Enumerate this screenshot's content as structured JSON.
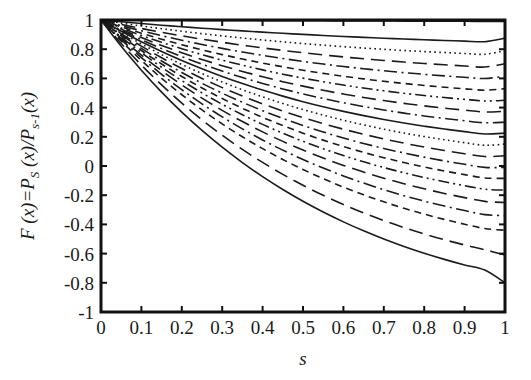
{
  "chart_data": {
    "type": "line",
    "title": "",
    "subtitle": "",
    "xlabel": "s",
    "ylabel": "F (x)=P_s(x)/P_{s-1}(x)",
    "ylabel_parts": {
      "f_of_x": "F (x)=P",
      "sub_s": "S",
      "mid": " (x)/P",
      "sub_s_minus_1": "s-1",
      "tail": "(x)"
    },
    "xlim": [
      0,
      1
    ],
    "ylim": [
      -1,
      1
    ],
    "xticks": [
      0,
      0.1,
      0.2,
      0.3,
      0.4,
      0.5,
      0.6,
      0.7,
      0.8,
      0.9,
      1
    ],
    "xtick_labels": [
      "0",
      "0.1",
      "0.2",
      "0.3",
      "0.4",
      "0.5",
      "0.6",
      "0.7",
      "0.8",
      "0.9",
      "1"
    ],
    "yticks": [
      -1,
      -0.8,
      -0.6,
      -0.4,
      -0.2,
      0,
      0.2,
      0.4,
      0.6,
      0.8,
      1
    ],
    "ytick_labels": [
      "-1",
      "-0.8",
      "-0.6",
      "-0.4",
      "-0.2",
      "0",
      "0.2",
      "0.4",
      "0.6",
      "0.8",
      "1"
    ],
    "grid": false,
    "legend": false,
    "legend_position": "none",
    "frame": "box",
    "tick_direction": "in",
    "line_color": "#1b1b1b",
    "background_color": "#ffffff",
    "x": [
      0,
      0.05,
      0.1,
      0.15,
      0.2,
      0.25,
      0.3,
      0.35,
      0.4,
      0.45,
      0.5,
      0.55,
      0.6,
      0.65,
      0.7,
      0.75,
      0.8,
      0.85,
      0.9,
      0.95,
      1
    ],
    "series": [
      {
        "name": "curve-1",
        "style": "solid",
        "endpoint": 0.99,
        "values": [
          1,
          0.9995,
          0.999,
          0.9985,
          0.998,
          0.9975,
          0.997,
          0.9965,
          0.996,
          0.9955,
          0.995,
          0.9945,
          0.994,
          0.9935,
          0.993,
          0.9925,
          0.992,
          0.9915,
          0.991,
          0.9905,
          0.99
        ]
      },
      {
        "name": "curve-2",
        "style": "solid",
        "endpoint": 0.875,
        "values": [
          1,
          0.9875,
          0.9757,
          0.9645,
          0.9539,
          0.9439,
          0.9344,
          0.9254,
          0.9169,
          0.9089,
          0.9013,
          0.8942,
          0.8875,
          0.8812,
          0.8753,
          0.8698,
          0.8647,
          0.8599,
          0.8555,
          0.8514,
          0.875
        ]
      },
      {
        "name": "curve-3",
        "style": "dotted",
        "endpoint": 0.79,
        "values": [
          1,
          0.9788,
          0.9589,
          0.9403,
          0.9228,
          0.9064,
          0.891,
          0.8766,
          0.8631,
          0.8505,
          0.8387,
          0.8277,
          0.8175,
          0.808,
          0.7992,
          0.7911,
          0.7837,
          0.7769,
          0.7707,
          0.7651,
          0.79
        ]
      },
      {
        "name": "curve-4",
        "style": "dashed-long",
        "endpoint": 0.7,
        "values": [
          1,
          0.9701,
          0.9421,
          0.9159,
          0.8915,
          0.8686,
          0.8473,
          0.8274,
          0.8089,
          0.7917,
          0.7757,
          0.7608,
          0.7471,
          0.7344,
          0.7227,
          0.712,
          0.7022,
          0.6933,
          0.6852,
          0.6779,
          0.7
        ]
      },
      {
        "name": "curve-5",
        "style": "dash-dot",
        "endpoint": 0.615,
        "values": [
          1,
          0.9617,
          0.9259,
          0.8925,
          0.8614,
          0.8325,
          0.8056,
          0.7806,
          0.7575,
          0.7361,
          0.7164,
          0.6982,
          0.6815,
          0.6662,
          0.6522,
          0.6394,
          0.6278,
          0.6173,
          0.6078,
          0.5993,
          0.615
        ]
      },
      {
        "name": "curve-6",
        "style": "dashed",
        "endpoint": 0.53,
        "values": [
          1,
          0.953,
          0.9092,
          0.8684,
          0.8305,
          0.7954,
          0.7629,
          0.7328,
          0.7051,
          0.6795,
          0.6559,
          0.6343,
          0.6145,
          0.5965,
          0.5801,
          0.5652,
          0.5518,
          0.5397,
          0.5289,
          0.5193,
          0.53
        ]
      },
      {
        "name": "curve-7",
        "style": "dash-dot-dot",
        "endpoint": 0.45,
        "values": [
          1,
          0.9452,
          0.8944,
          0.8471,
          0.8033,
          0.7627,
          0.7251,
          0.6904,
          0.6584,
          0.629,
          0.6019,
          0.5771,
          0.5545,
          0.5338,
          0.515,
          0.498,
          0.4827,
          0.4689,
          0.4566,
          0.4457,
          0.45
        ]
      },
      {
        "name": "curve-8",
        "style": "dashed-long",
        "endpoint": 0.375,
        "values": [
          1,
          0.9376,
          0.8796,
          0.8258,
          0.7759,
          0.7297,
          0.687,
          0.6476,
          0.6112,
          0.5777,
          0.547,
          0.5188,
          0.4931,
          0.4697,
          0.4484,
          0.4292,
          0.4118,
          0.3963,
          0.3824,
          0.37,
          0.375
        ]
      },
      {
        "name": "curve-9",
        "style": "dash-dot",
        "endpoint": 0.3,
        "values": [
          1,
          0.93,
          0.8651,
          0.8049,
          0.7492,
          0.6977,
          0.65,
          0.606,
          0.5655,
          0.5281,
          0.4938,
          0.4623,
          0.4336,
          0.4074,
          0.3837,
          0.3622,
          0.3428,
          0.3255,
          0.31,
          0.2962,
          0.3
        ]
      },
      {
        "name": "curve-10",
        "style": "solid",
        "endpoint": 0.225,
        "values": [
          1,
          0.9225,
          0.8506,
          0.7841,
          0.7225,
          0.6656,
          0.613,
          0.5645,
          0.5198,
          0.4786,
          0.4407,
          0.406,
          0.3742,
          0.3451,
          0.3186,
          0.2945,
          0.2727,
          0.253,
          0.2352,
          0.2193,
          0.225
        ]
      },
      {
        "name": "curve-11",
        "style": "dotted",
        "endpoint": 0.15,
        "values": [
          1,
          0.915,
          0.8361,
          0.7631,
          0.6955,
          0.6331,
          0.5755,
          0.5223,
          0.4733,
          0.4282,
          0.3867,
          0.3486,
          0.3136,
          0.2816,
          0.2524,
          0.2257,
          0.2015,
          0.1795,
          0.1597,
          0.1419,
          0.15
        ]
      },
      {
        "name": "curve-12",
        "style": "dashed-long",
        "endpoint": 0.07,
        "values": [
          1,
          0.907,
          0.8209,
          0.7412,
          0.6676,
          0.5996,
          0.5368,
          0.479,
          0.4257,
          0.3766,
          0.3315,
          0.2901,
          0.2521,
          0.2173,
          0.1855,
          0.1564,
          0.13,
          0.106,
          0.0843,
          0.0647,
          0.07
        ]
      },
      {
        "name": "curve-13",
        "style": "dash-dot",
        "endpoint": -0.01,
        "values": [
          1,
          0.899,
          0.8056,
          0.7194,
          0.6399,
          0.5665,
          0.4988,
          0.4364,
          0.3789,
          0.326,
          0.2774,
          0.2328,
          0.1919,
          0.1544,
          0.1202,
          0.089,
          0.0606,
          0.0348,
          0.0115,
          -0.0096,
          -0.01
        ]
      },
      {
        "name": "curve-14",
        "style": "dashed",
        "endpoint": -0.085,
        "values": [
          1,
          0.8915,
          0.7912,
          0.6986,
          0.6133,
          0.5345,
          0.4619,
          0.3951,
          0.3335,
          0.2769,
          0.2249,
          0.1772,
          0.1335,
          0.0934,
          0.0569,
          0.0236,
          -0.0068,
          -0.0344,
          -0.0593,
          -0.0818,
          -0.085
        ]
      },
      {
        "name": "curve-15",
        "style": "dash-dot-dot",
        "endpoint": -0.165,
        "values": [
          1,
          0.8835,
          0.7759,
          0.6766,
          0.585,
          0.5005,
          0.4227,
          0.3511,
          0.2852,
          0.2246,
          0.169,
          0.118,
          0.0712,
          0.0284,
          -0.0107,
          -0.0463,
          -0.0787,
          -0.1082,
          -0.1349,
          -0.159,
          -0.165
        ]
      },
      {
        "name": "curve-16",
        "style": "dashed-long",
        "endpoint": -0.25,
        "values": [
          1,
          0.875,
          0.7597,
          0.6532,
          0.5551,
          0.4645,
          0.3811,
          0.3043,
          0.2337,
          0.1687,
          0.1091,
          0.0544,
          0.0042,
          -0.0416,
          -0.0835,
          -0.1216,
          -0.1563,
          -0.1879,
          -0.2165,
          -0.2423,
          -0.25
        ]
      },
      {
        "name": "curve-17",
        "style": "dash-dot",
        "endpoint": -0.34,
        "values": [
          1,
          0.866,
          0.7424,
          0.6281,
          0.5228,
          0.4257,
          0.3363,
          0.254,
          0.1783,
          0.1086,
          0.0446,
          -0.0141,
          -0.068,
          -0.1172,
          -0.1622,
          -0.2032,
          -0.2405,
          -0.2744,
          -0.3051,
          -0.3329,
          -0.34
        ]
      },
      {
        "name": "curve-18",
        "style": "dashed",
        "endpoint": -0.44,
        "values": [
          1,
          0.856,
          0.7233,
          0.6008,
          0.488,
          0.384,
          0.2883,
          0.2002,
          0.1191,
          0.0445,
          -0.0241,
          -0.0869,
          -0.1446,
          -0.1974,
          -0.2456,
          -0.2895,
          -0.3295,
          -0.3658,
          -0.3987,
          -0.4285,
          -0.44
        ]
      },
      {
        "name": "curve-19",
        "style": "dashed-long",
        "endpoint": -0.61,
        "values": [
          1,
          0.839,
          0.6913,
          0.5555,
          0.4306,
          0.3158,
          0.2103,
          0.1134,
          0.0245,
          -0.0572,
          -0.1322,
          -0.2009,
          -0.2638,
          -0.3214,
          -0.374,
          -0.4219,
          -0.4655,
          -0.5051,
          -0.5409,
          -0.5733,
          -0.61
        ]
      },
      {
        "name": "curve-20",
        "style": "solid",
        "endpoint": -0.8,
        "values": [
          1,
          0.82,
          0.6562,
          0.5063,
          0.3691,
          0.2435,
          0.1285,
          0.0232,
          -0.0731,
          -0.1613,
          -0.2418,
          -0.3154,
          -0.3826,
          -0.444,
          -0.5,
          -0.551,
          -0.5974,
          -0.6396,
          -0.6779,
          -0.7126,
          -0.8
        ]
      }
    ]
  },
  "axes": {
    "x_title": "s",
    "y_title_f": "F",
    "y_title_x1": " (x)=",
    "y_title_p1": "P",
    "y_title_p1sub": "S",
    "y_title_x2": " (x)/",
    "y_title_p2": "P",
    "y_title_p2sub": "s-1",
    "y_title_x3": "(x)"
  }
}
